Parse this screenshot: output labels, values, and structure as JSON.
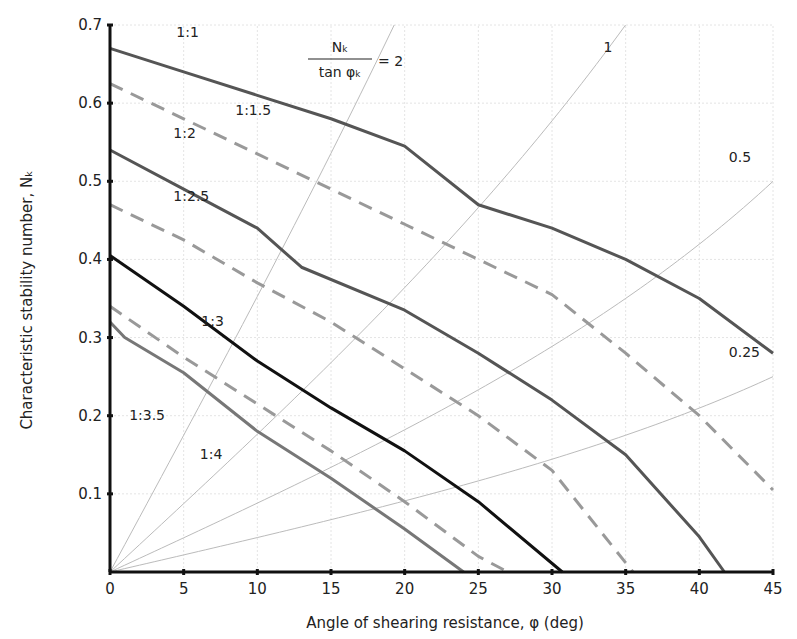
{
  "chart_data": {
    "type": "line",
    "title": "",
    "xlabel": "Angle of shearing resistance, φ (deg)",
    "ylabel": "Characteristic stability number, Nₖ",
    "xlim": [
      0,
      45
    ],
    "ylim": [
      0,
      0.7
    ],
    "xticks": [
      0,
      5,
      10,
      15,
      20,
      25,
      30,
      35,
      40,
      45
    ],
    "yticks": [
      0.1,
      0.2,
      0.3,
      0.4,
      0.5,
      0.6,
      0.7
    ],
    "grid": true,
    "legend": "none (inline labels)",
    "series": [
      {
        "name": "1:1",
        "style": "solid",
        "color": "#555555",
        "width": 3,
        "points": [
          [
            0,
            0.67
          ],
          [
            5,
            0.64
          ],
          [
            10,
            0.61
          ],
          [
            15,
            0.58
          ],
          [
            20,
            0.545
          ],
          [
            25,
            0.47
          ],
          [
            30,
            0.44
          ],
          [
            35,
            0.4
          ],
          [
            40,
            0.35
          ],
          [
            45,
            0.28
          ]
        ],
        "label_pos": [
          4.5,
          0.685
        ]
      },
      {
        "name": "1:1.5",
        "style": "dashed",
        "color": "#999999",
        "width": 3,
        "points": [
          [
            0,
            0.625
          ],
          [
            5,
            0.58
          ],
          [
            10,
            0.535
          ],
          [
            15,
            0.49
          ],
          [
            20,
            0.445
          ],
          [
            25,
            0.4
          ],
          [
            30,
            0.355
          ],
          [
            35,
            0.28
          ],
          [
            40,
            0.2
          ],
          [
            45,
            0.105
          ]
        ],
        "label_pos": [
          8.5,
          0.585
        ]
      },
      {
        "name": "1:2",
        "style": "solid",
        "color": "#555555",
        "width": 3,
        "points": [
          [
            0,
            0.54
          ],
          [
            5,
            0.49
          ],
          [
            10,
            0.44
          ],
          [
            13,
            0.39
          ],
          [
            20,
            0.335
          ],
          [
            25,
            0.28
          ],
          [
            30,
            0.22
          ],
          [
            35,
            0.15
          ],
          [
            40,
            0.045
          ],
          [
            41.7,
            0
          ]
        ],
        "label_pos": [
          4.3,
          0.555
        ]
      },
      {
        "name": "1:2.5",
        "style": "dashed",
        "color": "#999999",
        "width": 3,
        "points": [
          [
            0,
            0.47
          ],
          [
            5,
            0.425
          ],
          [
            10,
            0.37
          ],
          [
            15,
            0.32
          ],
          [
            20,
            0.26
          ],
          [
            25,
            0.2
          ],
          [
            30,
            0.13
          ],
          [
            35.5,
            0
          ]
        ],
        "label_pos": [
          4.3,
          0.475
        ]
      },
      {
        "name": "1:3",
        "style": "solid",
        "color": "#111111",
        "width": 3,
        "points": [
          [
            0,
            0.405
          ],
          [
            5,
            0.34
          ],
          [
            10,
            0.27
          ],
          [
            15,
            0.21
          ],
          [
            20,
            0.155
          ],
          [
            25,
            0.09
          ],
          [
            30.7,
            0
          ]
        ],
        "label_pos": [
          6.2,
          0.315
        ]
      },
      {
        "name": "1:3.5",
        "style": "dashed",
        "color": "#999999",
        "width": 3,
        "points": [
          [
            0,
            0.34
          ],
          [
            5,
            0.275
          ],
          [
            10,
            0.215
          ],
          [
            15,
            0.155
          ],
          [
            20,
            0.09
          ],
          [
            25,
            0.02
          ],
          [
            27,
            0
          ]
        ],
        "label_pos": [
          1.3,
          0.195
        ]
      },
      {
        "name": "1:4",
        "style": "solid",
        "color": "#777777",
        "width": 3,
        "points": [
          [
            0,
            0.32
          ],
          [
            1,
            0.3
          ],
          [
            5,
            0.255
          ],
          [
            10,
            0.18
          ],
          [
            15,
            0.12
          ],
          [
            20,
            0.055
          ],
          [
            24,
            0
          ]
        ],
        "label_pos": [
          6.1,
          0.145
        ]
      }
    ],
    "reference_lines": {
      "formula": "Nₖ / tan φₖ = k",
      "values": [
        {
          "k": 2,
          "label": "2"
        },
        {
          "k": 1,
          "label": "1"
        },
        {
          "k": 0.5,
          "label": "0.5"
        },
        {
          "k": 0.25,
          "label": "0.25"
        }
      ],
      "color": "#bbbbbb"
    },
    "annotation": {
      "numerator": "Nₖ",
      "denominator": "tan φₖ",
      "equals": "= 2"
    }
  }
}
